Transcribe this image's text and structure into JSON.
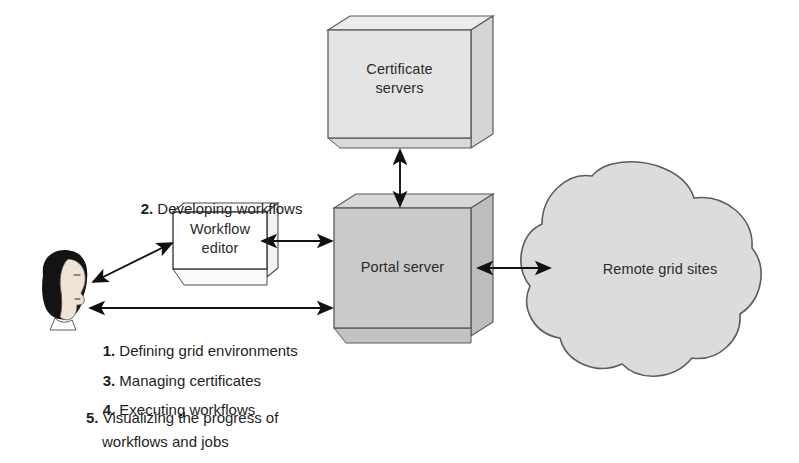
{
  "diagram": {
    "background_color": "#ffffff",
    "nodes": {
      "certificate_servers": {
        "label": "Certificate\nservers",
        "shape": "3d-box",
        "fill": "#e2e2e2",
        "stroke": "#555555"
      },
      "portal_server": {
        "label": "Portal server",
        "shape": "3d-box",
        "fill": "#c9c9c9",
        "stroke": "#555555"
      },
      "workflow_editor": {
        "label": "Workflow\neditor",
        "shape": "3d-box",
        "fill": "#ffffff",
        "stroke": "#444444"
      },
      "remote_grid_sites": {
        "label": "Remote grid sites",
        "shape": "cloud",
        "fill": "#dadada",
        "stroke": "#555555"
      },
      "user": {
        "label": "",
        "shape": "person-head-profile",
        "fill": "#1a1a1a"
      }
    },
    "connections": [
      {
        "name": "certificate-servers-to-portal-server",
        "from": "certificate_servers",
        "to": "portal_server",
        "style": "double-arrow",
        "orientation": "vertical"
      },
      {
        "name": "workflow-editor-to-portal-server",
        "from": "workflow_editor",
        "to": "portal_server",
        "style": "double-arrow",
        "orientation": "horizontal"
      },
      {
        "name": "portal-server-to-remote-grid-sites",
        "from": "portal_server",
        "to": "remote_grid_sites",
        "style": "double-arrow",
        "orientation": "horizontal"
      },
      {
        "name": "user-to-workflow-editor",
        "from": "user",
        "to": "workflow_editor",
        "style": "double-arrow",
        "orientation": "diagonal"
      },
      {
        "name": "user-to-portal-server",
        "from": "user",
        "to": "portal_server",
        "style": "double-arrow",
        "orientation": "horizontal"
      }
    ],
    "annotations": {
      "developing_workflows": {
        "number": "2.",
        "text": " Developing workflows"
      }
    },
    "task_list": [
      {
        "number": "1.",
        "text": " Defining grid environments"
      },
      {
        "number": "3.",
        "text": " Managing certificates"
      },
      {
        "number": "4.",
        "text": " Executing workflows"
      },
      {
        "number": "5.",
        "line1": " Visualizing the progress of",
        "line2": "workflows and jobs"
      }
    ]
  }
}
